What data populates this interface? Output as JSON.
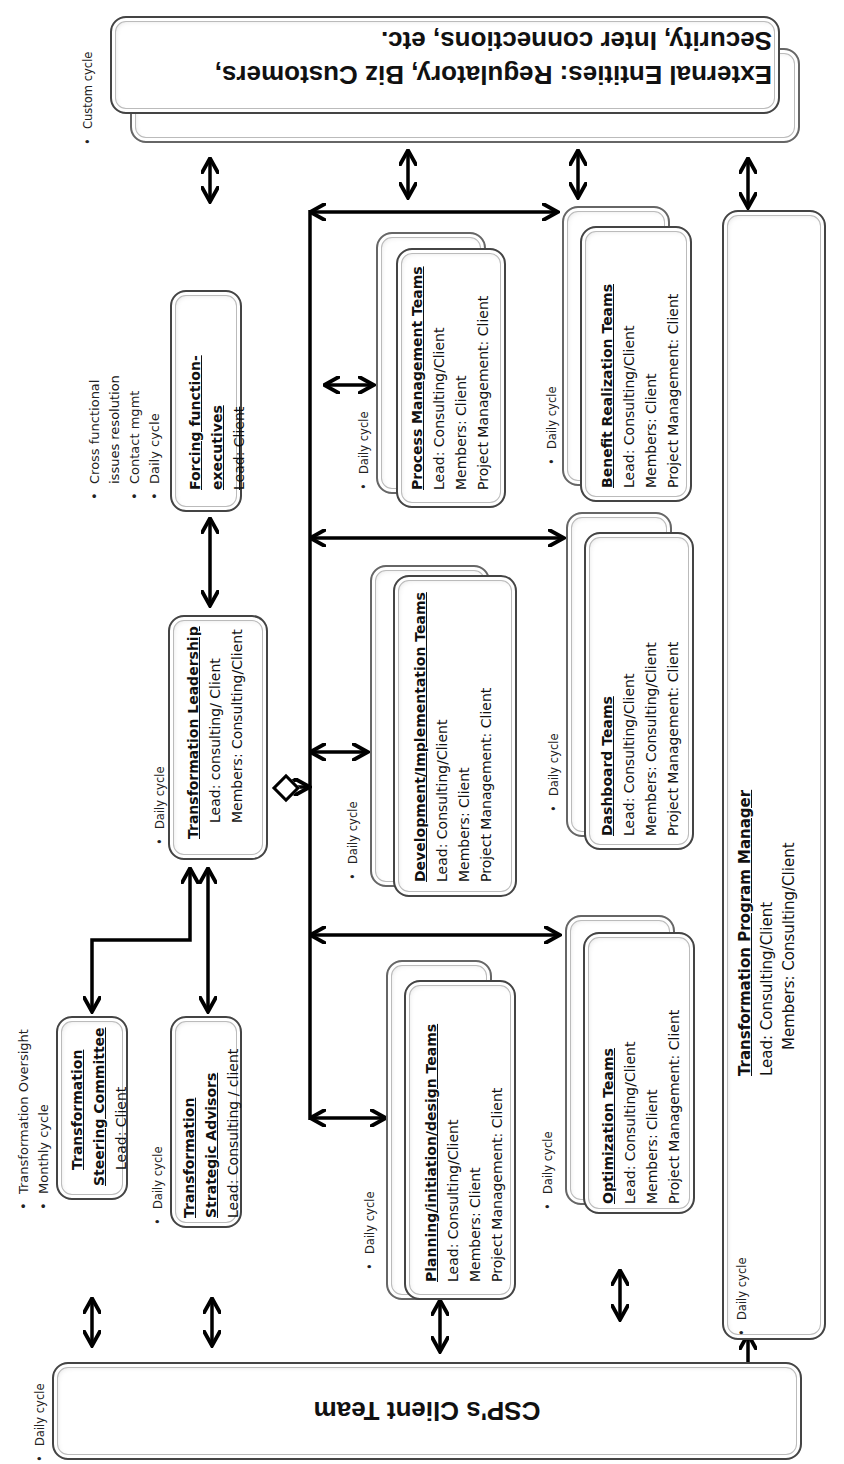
{
  "external_entities": {
    "line1": "External Entities: Regulatory,  Biz Customers,",
    "line2": "Security, Inter connections, etc.",
    "cycle_note": "Custom  cycle"
  },
  "client_team": {
    "title": "CSP's Client Team",
    "cycle_note": "Daily cycle"
  },
  "steering_committee": {
    "title_line1": "Transformation",
    "title_line2": "Steering Committee",
    "lead": "Lead:  Client",
    "notes": [
      "Transformation Oversight",
      "Monthly cycle"
    ]
  },
  "strategic_advisors": {
    "title_line1": "Transformation",
    "title_line2": "Strategic Advisors",
    "lead": "Lead: Consulting / client",
    "cycle_note": "Daily cycle"
  },
  "transformation_leadership": {
    "title": "Transformation Leadership",
    "lead": "Lead: consulting/ Client",
    "members": "Members: Consulting/Client",
    "cycle_note": "Daily cycle"
  },
  "forcing_function": {
    "title_line1": "Forcing function-",
    "title_line2": "executives",
    "lead": "Lead: Client",
    "notes": [
      "Cross functional",
      "issues resolution",
      "Contact mgmt",
      "Daily cycle"
    ]
  },
  "teams": [
    {
      "id": "planning",
      "title": "Planning/initiation/design Teams",
      "lead": "Lead:  Consulting/Client",
      "members": "Members: Client",
      "pm": "Project Management: Client",
      "cycle_note": "Daily cycle"
    },
    {
      "id": "development",
      "title": "Development/Implementation Teams",
      "lead": "Lead:  Consulting/Client",
      "members": "Members: Client",
      "pm": "Project Management: Client",
      "cycle_note": "Daily cycle"
    },
    {
      "id": "process",
      "title": "Process Management  Teams",
      "lead": "Lead:  Consulting/Client",
      "members": "Members: Client",
      "pm": "Project Management: Client",
      "cycle_note": "Daily cycle"
    },
    {
      "id": "optimization",
      "title": "Optimization Teams",
      "lead": "Lead:  Consulting/Client",
      "members": "Members: Client",
      "pm": "Project Management: Client",
      "cycle_note": "Daily cycle"
    },
    {
      "id": "dashboard",
      "title": "Dashboard Teams",
      "lead": "Lead:  Consulting/Client",
      "members": "Members: Consulting/Client",
      "pm": "Project Management: Client",
      "cycle_note": "Daily cycle"
    },
    {
      "id": "benefit",
      "title": "Benefit Realization Teams",
      "lead": "Lead:  Consulting/Client",
      "members": "Members: Client",
      "pm": "Project Management: Client",
      "cycle_note": "Daily cycle"
    }
  ],
  "program_manager": {
    "title": "Transformation Program Manager",
    "lead": "Lead: Consulting/Client",
    "members": "Members: Consulting/Client",
    "cycle_note": "Daily cycle"
  },
  "colors": {
    "line": "#000000",
    "box_border": "#444444",
    "background": "#ffffff"
  }
}
